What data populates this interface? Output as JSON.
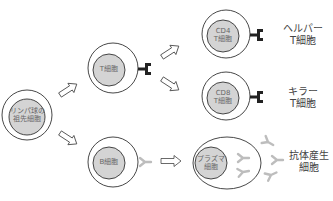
{
  "diagram": {
    "title": "",
    "nodes": [
      {
        "id": "progenitor",
        "label_lines": [
          "リンパ球の",
          "祖先細胞"
        ]
      },
      {
        "id": "t_cell",
        "label_lines": [
          "T細胞"
        ]
      },
      {
        "id": "cd4",
        "label_lines": [
          "CD4",
          "T細胞"
        ],
        "side_label_lines": [
          "ヘルパー",
          "T細胞"
        ]
      },
      {
        "id": "cd8",
        "label_lines": [
          "CD8",
          "T細胞"
        ],
        "side_label_lines": [
          "キラー",
          "T細胞"
        ]
      },
      {
        "id": "b_cell",
        "label_lines": [
          "B細胞"
        ]
      },
      {
        "id": "plasma",
        "label_lines": [
          "プラズマ",
          "細胞"
        ],
        "side_label_lines": [
          "抗体産生",
          "細胞"
        ]
      }
    ],
    "edges": [
      {
        "from": "progenitor",
        "to": "t_cell"
      },
      {
        "from": "progenitor",
        "to": "b_cell"
      },
      {
        "from": "t_cell",
        "to": "cd4"
      },
      {
        "from": "t_cell",
        "to": "cd8"
      },
      {
        "from": "b_cell",
        "to": "plasma"
      }
    ],
    "icons": {
      "t_cell_receptor": "T-cell receptor (dark, T-cell/CD4/CD8)",
      "antibody": "Y-shaped antibody (light gray)"
    },
    "colors": {
      "nucleus_fill": "#d4d4d4",
      "outline": "#333333",
      "receptor": "#222222",
      "antibody": "#bdbdbd"
    }
  }
}
